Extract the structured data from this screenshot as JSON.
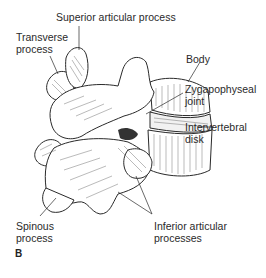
{
  "figure": {
    "panel_letter": "B",
    "labels": {
      "superior_articular_process": "Superior articular process",
      "transverse_process_l1": "Transverse",
      "transverse_process_l2": "process",
      "body": "Body",
      "zygapophyseal_joint_l1": "Zygapophyseal",
      "zygapophyseal_joint_l2": "joint",
      "intervertebral_disk_l1": "Intervertebral",
      "intervertebral_disk_l2": "disk",
      "spinous_process_l1": "Spinous",
      "spinous_process_l2": "process",
      "inferior_articular_processes_l1": "Inferior articular",
      "inferior_articular_processes_l2": "processes"
    },
    "colors": {
      "line": "#2a2a2a",
      "hatch": "#555555",
      "background": "#ffffff"
    }
  }
}
